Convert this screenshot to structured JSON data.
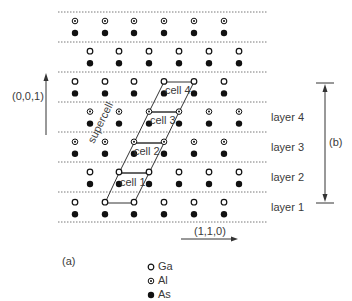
{
  "figure": {
    "panel_a_label": "(a)",
    "panel_b_label": "(b)",
    "axis_vertical_label": "(0,0,1)",
    "axis_horizontal_label": "(1,1,0)",
    "supercell_label": "supercell",
    "cells": [
      {
        "label": "cell 1"
      },
      {
        "label": "cell 2"
      },
      {
        "label": "cell 3"
      },
      {
        "label": "cell 4"
      }
    ],
    "layers": [
      {
        "label": "layer 4"
      },
      {
        "label": "layer 3"
      },
      {
        "label": "layer 2"
      },
      {
        "label": "layer 1"
      }
    ],
    "legend": [
      {
        "symbol": "open-circle",
        "label": "Ga"
      },
      {
        "symbol": "dotted-circle",
        "label": "Al"
      },
      {
        "symbol": "filled-circle",
        "label": "As"
      }
    ],
    "rows_top_to_bottom": [
      {
        "cation": "Al",
        "offset": "even"
      },
      {
        "cation": "Ga",
        "offset": "odd"
      },
      {
        "cation": "Ga",
        "offset": "even"
      },
      {
        "cation": "Al",
        "offset": "odd"
      },
      {
        "cation": "Al",
        "offset": "even"
      },
      {
        "cation": "Ga",
        "offset": "odd"
      },
      {
        "cation": "Ga",
        "offset": "even"
      }
    ],
    "colors": {
      "line": "#333333",
      "dashed": "#555555",
      "atom": "#111111"
    }
  }
}
